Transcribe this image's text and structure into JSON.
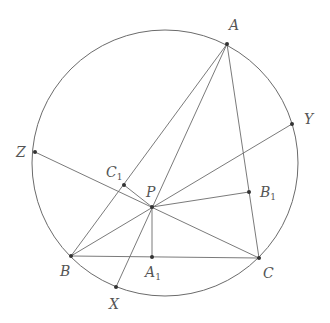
{
  "diagram": {
    "type": "geometry",
    "circle": {
      "cx": 165,
      "cy": 163,
      "r": 133
    },
    "points": [
      {
        "id": "A",
        "label": "A",
        "sub": "",
        "x": 227,
        "y": 44,
        "lx": 229,
        "ly": 30
      },
      {
        "id": "B",
        "label": "B",
        "sub": "",
        "x": 71,
        "y": 256,
        "lx": 60,
        "ly": 276
      },
      {
        "id": "C",
        "label": "C",
        "sub": "",
        "x": 259,
        "y": 258,
        "lx": 263,
        "ly": 278
      },
      {
        "id": "P",
        "label": "P",
        "sub": "",
        "x": 152,
        "y": 207,
        "lx": 146,
        "ly": 197
      },
      {
        "id": "X",
        "label": "X",
        "sub": "",
        "x": 116,
        "y": 287,
        "lx": 109,
        "ly": 309
      },
      {
        "id": "Y",
        "label": "Y",
        "sub": "",
        "x": 292,
        "y": 124,
        "lx": 304,
        "ly": 124
      },
      {
        "id": "Z",
        "label": "Z",
        "sub": "",
        "x": 35,
        "y": 152,
        "lx": 16,
        "ly": 157
      },
      {
        "id": "A1",
        "label": "A",
        "sub": "1",
        "x": 152,
        "y": 257,
        "lx": 145,
        "ly": 277
      },
      {
        "id": "B1",
        "label": "B",
        "sub": "1",
        "x": 249,
        "y": 192,
        "lx": 260,
        "ly": 197
      },
      {
        "id": "C1",
        "label": "C",
        "sub": "1",
        "x": 124,
        "y": 185,
        "lx": 106,
        "ly": 177
      }
    ],
    "segments": [
      [
        "A",
        "B"
      ],
      [
        "B",
        "C"
      ],
      [
        "C",
        "A"
      ],
      [
        "A",
        "X"
      ],
      [
        "B",
        "Y"
      ],
      [
        "C",
        "Z"
      ],
      [
        "P",
        "A1"
      ],
      [
        "P",
        "B1"
      ],
      [
        "P",
        "C1"
      ]
    ]
  }
}
